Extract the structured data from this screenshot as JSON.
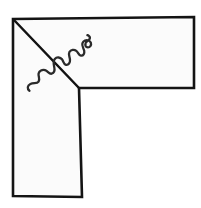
{
  "figure": {
    "kind": "line-drawing",
    "background_color": "#ffffff",
    "fill_color": "#fbfbfb",
    "stroke_color": "#141414",
    "canvas": {
      "width": 201,
      "height": 208
    },
    "elements": {
      "outline": {
        "name": "L-shaped polygon",
        "stroke_color": "#141414",
        "stroke_width": 2.6,
        "points": "13,19 194,17 194,88 79,88 82,197 13,196"
      },
      "diagonal": {
        "name": "diagonal line from top-left corner to inner corner",
        "stroke_color": "#121212",
        "stroke_width": 2.5,
        "from": "13,19",
        "to": "79,88"
      },
      "squiggle": {
        "name": "wavy squiggle crossing the diagonal",
        "stroke_color": "#2a2a2a",
        "stroke_width": 2.3,
        "start": "29,91",
        "end": "88,35",
        "path": "M 29.5 90.8 C 26.8 88.6 27.4 85.4 30.4 84.0 C 33.6 82.5 37.0 83.9 38.6 81.6 C 40.4 79.0 38.0 76.4 38.6 73.6 C 39.2 70.9 42.3 69.4 45.0 70.2 C 47.9 71.1 49.0 74.3 51.6 73.7 C 54.4 73.0 54.8 69.6 54.2 66.8 C 53.6 63.9 52.9 61.0 54.8 58.9 C 56.8 56.7 60.3 57.2 62.0 59.3 C 63.7 61.4 63.4 64.3 65.9 64.8 C 68.6 65.3 70.2 62.6 70.0 59.8 C 69.8 56.9 68.1 54.4 69.4 52.0 C 70.8 49.5 74.2 49.2 76.3 50.8 C 78.5 52.5 78.6 55.3 80.9 55.6 C 83.4 55.9 84.7 53.4 84.2 50.8 C 83.6 48.1 81.6 45.9 82.4 43.3 C 83.2 40.7 86.3 39.5 88.6 40.5 C 90.9 41.5 91.8 44.2 90.4 46.1 C 89.1 47.9 86.5 47.9 85.6 46.0 C 84.8 44.2 85.9 41.9 87.6 40.8 C 88.5 40.2 89.2 39.8 89.6 39.0 C 90.1 38.0 89.7 36.6 88.8 35.9 C 88.3 35.5 87.8 35.3 87.4 35.2"
      }
    }
  }
}
